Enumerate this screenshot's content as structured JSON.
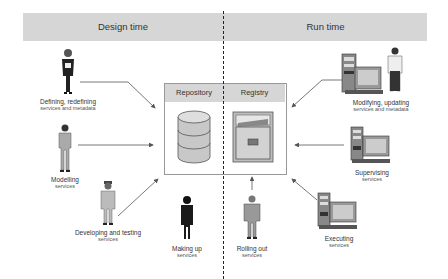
{
  "header": {
    "left_title": "Design time",
    "right_title": "Run time"
  },
  "central_box": {
    "repository_label": "Repository",
    "registry_label": "Registry",
    "repository_icon": "database-icon",
    "registry_icon": "file-cabinet-icon"
  },
  "design_time": [
    {
      "line1": "Defining, redefining",
      "line2": "services and metadata",
      "icon": "woman-figure-icon"
    },
    {
      "line1": "Modelling",
      "line2": "services",
      "icon": "man-figure-icon"
    },
    {
      "line1": "Developing and testing",
      "line2": "services",
      "icon": "man-coat-figure-icon"
    },
    {
      "line1": "Making up",
      "line2": "services",
      "icon": "woman-dress-figure-icon"
    }
  ],
  "run_time": [
    {
      "line1": "Modifying, updating",
      "line2": "services and metadata",
      "icon": "computer-and-man-icon"
    },
    {
      "line1": "Supervising",
      "line2": "services",
      "icon": "computer-icon"
    },
    {
      "line1": "Executing",
      "line2": "services",
      "icon": "computer-icon"
    },
    {
      "line1": "Rolling out",
      "line2": "services",
      "icon": "man-suit-figure-icon"
    }
  ],
  "colors": {
    "band": "#d6d6d6",
    "divider": "#222222",
    "arrow": "#555555",
    "box_border": "#999999"
  }
}
